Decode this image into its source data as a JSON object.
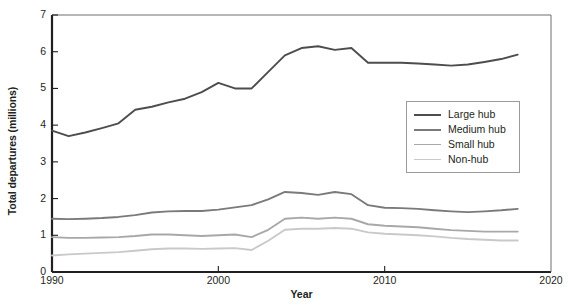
{
  "chart_data": {
    "type": "line",
    "title": "",
    "xlabel": "Year",
    "ylabel": "Total departures (millions)",
    "xlim": [
      1990,
      2020
    ],
    "ylim": [
      0,
      7
    ],
    "xticks": [
      1990,
      2000,
      2010,
      2020
    ],
    "yticks": [
      0,
      1,
      2,
      3,
      4,
      5,
      6,
      7
    ],
    "grid": false,
    "legend_position": "center-right",
    "x": [
      1990,
      1991,
      1992,
      1993,
      1994,
      1995,
      1996,
      1997,
      1998,
      1999,
      2000,
      2001,
      2002,
      2003,
      2004,
      2005,
      2006,
      2007,
      2008,
      2009,
      2010,
      2011,
      2012,
      2013,
      2014,
      2015,
      2016,
      2017,
      2018
    ],
    "series": [
      {
        "name": "Large hub",
        "color": "#4d4d4d",
        "values": [
          3.85,
          3.7,
          3.8,
          3.92,
          4.05,
          4.42,
          4.5,
          4.62,
          4.72,
          4.9,
          5.15,
          5.0,
          5.0,
          5.45,
          5.9,
          6.1,
          6.15,
          6.05,
          6.1,
          5.7,
          5.7,
          5.7,
          5.68,
          5.65,
          5.62,
          5.65,
          5.72,
          5.8,
          5.92
        ]
      },
      {
        "name": "Medium hub",
        "color": "#7a7a7a",
        "values": [
          1.45,
          1.44,
          1.45,
          1.47,
          1.5,
          1.55,
          1.62,
          1.65,
          1.66,
          1.66,
          1.7,
          1.76,
          1.82,
          1.98,
          2.18,
          2.15,
          2.1,
          2.18,
          2.12,
          1.82,
          1.75,
          1.74,
          1.72,
          1.68,
          1.65,
          1.63,
          1.65,
          1.68,
          1.72
        ]
      },
      {
        "name": "Small hub",
        "color": "#a8a8a8",
        "values": [
          0.95,
          0.93,
          0.93,
          0.94,
          0.95,
          0.98,
          1.02,
          1.02,
          1.0,
          0.98,
          1.0,
          1.02,
          0.95,
          1.15,
          1.45,
          1.48,
          1.45,
          1.48,
          1.45,
          1.3,
          1.26,
          1.24,
          1.22,
          1.18,
          1.14,
          1.12,
          1.1,
          1.1,
          1.1
        ]
      },
      {
        "name": "Non-hub",
        "color": "#c9c9c9",
        "values": [
          0.45,
          0.48,
          0.5,
          0.52,
          0.54,
          0.58,
          0.62,
          0.64,
          0.64,
          0.63,
          0.64,
          0.65,
          0.6,
          0.85,
          1.15,
          1.18,
          1.18,
          1.2,
          1.18,
          1.08,
          1.04,
          1.02,
          1.0,
          0.97,
          0.93,
          0.9,
          0.88,
          0.86,
          0.86
        ]
      }
    ]
  },
  "legend": {
    "items": [
      {
        "label": "Large hub"
      },
      {
        "label": "Medium hub"
      },
      {
        "label": "Small hub"
      },
      {
        "label": "Non-hub"
      }
    ]
  }
}
